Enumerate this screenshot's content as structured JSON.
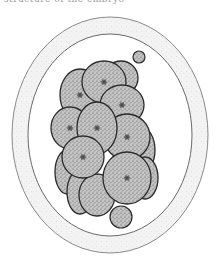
{
  "caption": "structure of the embryo",
  "colors": {
    "background": "#ffffff",
    "zona_outline": "#8a8a8a",
    "zona_fill": "#f1f1f1",
    "cell_outline": "#2a2a2a",
    "cell_fill": "#bdbdbd",
    "nucleus": "#333333"
  },
  "figure": {
    "zona": {
      "cx": 110,
      "cy": 135,
      "outer_rx": 98,
      "outer_ry": 118,
      "inner_rx": 82,
      "inner_ry": 101
    },
    "cells": [
      {
        "name": "cell-top-right-back",
        "cx": 121,
        "cy": 78,
        "rx": 17,
        "ry": 17,
        "nucleus": false
      },
      {
        "name": "cell-right-edge-back",
        "cx": 141,
        "cy": 150,
        "rx": 14,
        "ry": 23,
        "nucleus": false
      },
      {
        "name": "cell-right-lower-back",
        "cx": 145,
        "cy": 178,
        "rx": 13,
        "ry": 21,
        "nucleus": true
      },
      {
        "name": "cell-far-left-back",
        "cx": 67,
        "cy": 172,
        "rx": 12,
        "ry": 22,
        "nucleus": false
      },
      {
        "name": "cell-bottom-left-back",
        "cx": 80,
        "cy": 192,
        "rx": 13,
        "ry": 22,
        "nucleus": false
      },
      {
        "name": "cell-top-left",
        "cx": 80,
        "cy": 95,
        "rx": 20,
        "ry": 26,
        "nucleus": true
      },
      {
        "name": "cell-top-middle",
        "cx": 104,
        "cy": 82,
        "rx": 22,
        "ry": 21,
        "nucleus": true
      },
      {
        "name": "cell-right-upper",
        "cx": 122,
        "cy": 105,
        "rx": 22,
        "ry": 20,
        "nucleus": true
      },
      {
        "name": "cell-left-middle",
        "cx": 70,
        "cy": 128,
        "rx": 19,
        "ry": 21,
        "nucleus": true
      },
      {
        "name": "cell-right-middle",
        "cx": 127,
        "cy": 137,
        "rx": 23,
        "ry": 23,
        "nucleus": true
      },
      {
        "name": "cell-center",
        "cx": 97,
        "cy": 128,
        "rx": 20,
        "ry": 26,
        "nucleus": true
      },
      {
        "name": "cell-bottom-center",
        "cx": 97,
        "cy": 195,
        "rx": 18,
        "ry": 21,
        "nucleus": false
      },
      {
        "name": "cell-lower-right-big",
        "cx": 127,
        "cy": 178,
        "rx": 24,
        "ry": 26,
        "nucleus": true
      },
      {
        "name": "cell-lower-left-front",
        "cx": 83,
        "cy": 157,
        "rx": 21,
        "ry": 21,
        "nucleus": true
      }
    ],
    "polar_bodies": [
      {
        "name": "polar-body-top",
        "cx": 139,
        "cy": 57,
        "r": 6
      },
      {
        "name": "polar-body-bottom",
        "cx": 121,
        "cy": 217,
        "r": 11
      }
    ]
  }
}
